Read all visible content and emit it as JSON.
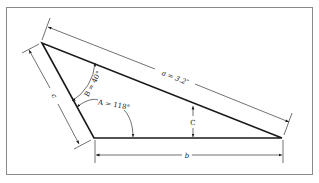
{
  "diagram": {
    "type": "triangle-dimension-drawing",
    "colors": {
      "background": "#ffffff",
      "frame": "#8a8a8a",
      "line": "#1a1a1a",
      "dim_line": "#333333"
    },
    "vertices": {
      "top_left": {
        "x": 42,
        "y": 43
      },
      "bottom_left": {
        "x": 94,
        "y": 138
      },
      "right": {
        "x": 282,
        "y": 138
      }
    },
    "labels": {
      "side_a": "a = 3.2″",
      "side_b": "b",
      "side_c": "c",
      "angle_A": "A = 118°",
      "angle_B": "B = 40°",
      "angle_C": "C"
    }
  }
}
